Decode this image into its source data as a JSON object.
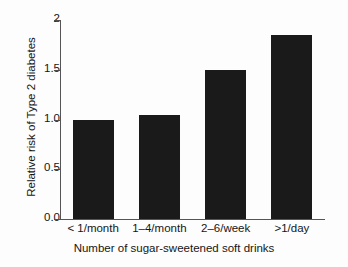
{
  "chart_data": {
    "type": "bar",
    "title": "",
    "xlabel": "Number of sugar-sweetened soft drinks",
    "ylabel": "Relative risk of Type 2 diabetes",
    "categories": [
      "< 1/month",
      "1–4/month",
      "2–6/week",
      ">1/day"
    ],
    "values": [
      1.0,
      1.05,
      1.5,
      1.85
    ],
    "ylim": [
      0.0,
      2.0
    ],
    "yticks": [
      0.0,
      0.5,
      1.0,
      1.5,
      2.0
    ],
    "ytick_labels": [
      "0.0",
      "0.5",
      "1.0",
      "1.5",
      "2"
    ],
    "grid": false,
    "legend": null,
    "bar_color": "#1a1a1a",
    "background_color": "#fdfdfd",
    "axis_color": "#555555"
  },
  "axes": {
    "y_title": "Relative risk of Type 2 diabetes",
    "x_title": "Number of sugar-sweetened soft drinks"
  }
}
